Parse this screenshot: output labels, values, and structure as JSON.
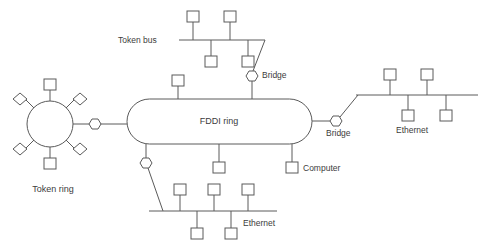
{
  "diagram": {
    "background_color": "#ffffff",
    "line_color": "#5a5a5a",
    "text_color": "#3c3c3c",
    "labels": {
      "token_bus": "Token bus",
      "bridge_top": "Bridge",
      "bridge_right": "Bridge",
      "fddi_ring": "FDDI ring",
      "computer": "Computer",
      "token_ring": "Token ring",
      "ethernet_right": "Ethernet",
      "ethernet_bottom": "Ethernet"
    },
    "icons": {
      "station": "computer-station-square-icon",
      "bridge": "bridge-hexagon-icon",
      "ring_node": "ring-station-diamond-icon",
      "backbone": "fddi-ring-stadium-icon"
    },
    "networks": [
      {
        "id": "token-bus",
        "name": "Token bus",
        "type": "bus",
        "stations_above": 2,
        "stations_below": 2,
        "connected_via": "Bridge"
      },
      {
        "id": "token-ring",
        "name": "Token ring",
        "type": "ring",
        "square_stations": 2,
        "diamond_stations": 4,
        "connected_via": "Bridge"
      },
      {
        "id": "fddi-ring",
        "name": "FDDI ring",
        "type": "backbone-ring",
        "direct_stations": 2,
        "bridges": 4
      },
      {
        "id": "ethernet-right",
        "name": "Ethernet",
        "type": "bus",
        "stations_above": 2,
        "stations_below": 2,
        "connected_via": "Bridge"
      },
      {
        "id": "ethernet-bottom",
        "name": "Ethernet",
        "type": "bus",
        "stations_above": 3,
        "stations_below": 2,
        "connected_via": "Bridge"
      }
    ]
  }
}
